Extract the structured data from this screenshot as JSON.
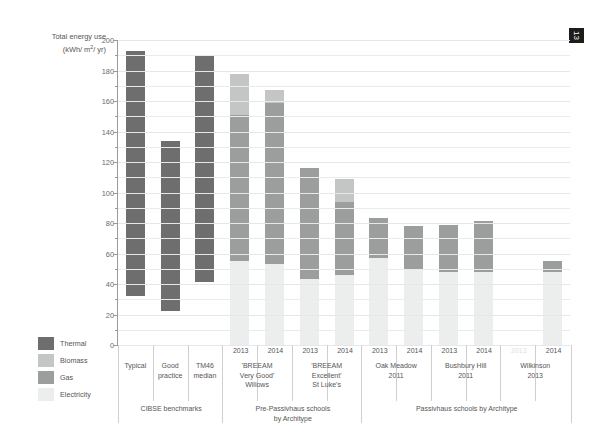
{
  "page_marker": "13",
  "axis_title": {
    "line1": "Total energy use",
    "line2_prefix": "(kWh/ m",
    "line2_sup": "2",
    "line2_suffix": "/ yr)"
  },
  "legend": {
    "items": [
      {
        "label": "Thermal",
        "color": "#6e6e6e"
      },
      {
        "label": "Biomass",
        "color": "#c4c6c6"
      },
      {
        "label": "Gas",
        "color": "#9c9e9e"
      },
      {
        "label": "Electricity",
        "color": "#eceeee"
      }
    ]
  },
  "chart_data": {
    "type": "bar",
    "title": "Total energy use (kWh/ m2/ yr)",
    "xlabel": "",
    "ylabel": "Total energy use (kWh/ m2/ yr)",
    "ylim": [
      0,
      200
    ],
    "ytick_step": 20,
    "yminor_step": 10,
    "grid": true,
    "stacked": true,
    "legend_position": "left-bottom",
    "ytick_labels": [
      "0",
      "20",
      "40",
      "60",
      "80",
      "100",
      "120",
      "140",
      "160",
      "180",
      "200"
    ],
    "series_names": [
      "Electricity",
      "Gas",
      "Biomass",
      "Thermal"
    ],
    "series_colors": {
      "Electricity": "#eceeee",
      "Gas": "#9c9e9e",
      "Biomass": "#c4c6c6",
      "Thermal": "#6e6e6e"
    },
    "groups": [
      {
        "name": "CIBSE benchmarks",
        "columns": [
          {
            "year": "",
            "name": "Typical",
            "total": 193,
            "floor": 32,
            "segments": [
              {
                "series": "Thermal",
                "from": 32,
                "to": 193
              }
            ]
          },
          {
            "year": "",
            "name": "Good\npractice",
            "total": 134,
            "floor": 22,
            "segments": [
              {
                "series": "Thermal",
                "from": 22,
                "to": 134
              }
            ]
          },
          {
            "year": "",
            "name": "TM46\nmedian",
            "total": 190,
            "floor": 41,
            "segments": [
              {
                "series": "Thermal",
                "from": 41,
                "to": 190
              }
            ]
          }
        ]
      },
      {
        "name": "Pre-Passivhaus schools\nby Architype",
        "columns": [
          {
            "year": "2013",
            "name": "'BREEAM\nVery Good'\nWillows",
            "total": 178,
            "floor": 0,
            "segments": [
              {
                "series": "Electricity",
                "from": 0,
                "to": 55
              },
              {
                "series": "Gas",
                "from": 55,
                "to": 151
              },
              {
                "series": "Biomass",
                "from": 151,
                "to": 178
              }
            ]
          },
          {
            "year": "2014",
            "name": "",
            "total": 167,
            "floor": 0,
            "segments": [
              {
                "series": "Electricity",
                "from": 0,
                "to": 53
              },
              {
                "series": "Gas",
                "from": 53,
                "to": 159
              },
              {
                "series": "Biomass",
                "from": 159,
                "to": 167
              }
            ]
          },
          {
            "year": "2013",
            "name": "'BREEAM\nExcellent'\nSt Luke's",
            "total": 116,
            "floor": 0,
            "segments": [
              {
                "series": "Electricity",
                "from": 0,
                "to": 43
              },
              {
                "series": "Gas",
                "from": 43,
                "to": 116
              }
            ]
          },
          {
            "year": "2014",
            "name": "",
            "total": 109,
            "floor": 0,
            "segments": [
              {
                "series": "Electricity",
                "from": 0,
                "to": 46
              },
              {
                "series": "Gas",
                "from": 46,
                "to": 94
              },
              {
                "series": "Biomass",
                "from": 94,
                "to": 109
              }
            ]
          }
        ]
      },
      {
        "name": "Passivhaus schools by Architype",
        "columns": [
          {
            "year": "2013",
            "name": "Oak Meadow\n2011",
            "total": 83,
            "floor": 0,
            "segments": [
              {
                "series": "Electricity",
                "from": 0,
                "to": 57
              },
              {
                "series": "Gas",
                "from": 57,
                "to": 83
              }
            ]
          },
          {
            "year": "2014",
            "name": "",
            "total": 78,
            "floor": 0,
            "segments": [
              {
                "series": "Electricity",
                "from": 0,
                "to": 50
              },
              {
                "series": "Gas",
                "from": 50,
                "to": 78
              }
            ]
          },
          {
            "year": "2013",
            "name": "Bushbury Hill\n2011",
            "total": 79,
            "floor": 0,
            "segments": [
              {
                "series": "Electricity",
                "from": 0,
                "to": 48
              },
              {
                "series": "Gas",
                "from": 48,
                "to": 79
              }
            ]
          },
          {
            "year": "2014",
            "name": "",
            "total": 81,
            "floor": 0,
            "segments": [
              {
                "series": "Electricity",
                "from": 0,
                "to": 48
              },
              {
                "series": "Gas",
                "from": 48,
                "to": 81
              }
            ]
          },
          {
            "year": "2013",
            "year_faded": true,
            "name": "Wilkinson\n2013",
            "total": 0,
            "floor": 0,
            "segments": []
          },
          {
            "year": "2014",
            "name": "",
            "total": 55,
            "floor": 0,
            "segments": [
              {
                "series": "Electricity",
                "from": 0,
                "to": 48
              },
              {
                "series": "Gas",
                "from": 48,
                "to": 55
              }
            ]
          }
        ]
      }
    ]
  }
}
